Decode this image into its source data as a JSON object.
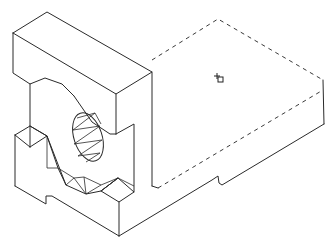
{
  "drawing": {
    "title": "Isometric view of bracket with bored hole and dashed (hidden) base plate",
    "view": "isometric",
    "line_color": "#2a2a2a",
    "background": "#ffffff",
    "features": {
      "upright_block": "solid block with C-shaped slot and through bore",
      "bore": "elliptical hole with triangulated facets",
      "base_plate": "slab extending right, top edges shown dashed",
      "notch": "small V notch on bottom front edge of base plate"
    },
    "cursor": {
      "type": "crosshair-with-box",
      "x": 218,
      "y": 78
    }
  }
}
